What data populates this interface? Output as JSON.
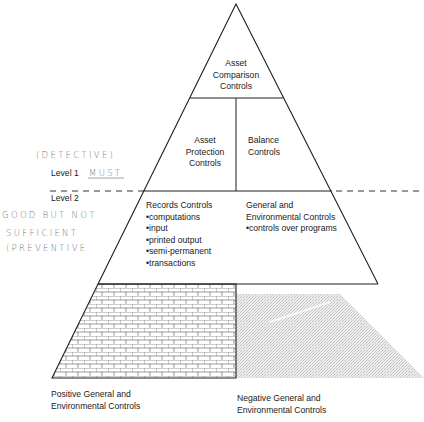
{
  "diagram": {
    "type": "control-hierarchy-pyramid",
    "tiers": [
      {
        "id": "top",
        "label_lines": [
          "Asset",
          "Comparison",
          "Controls"
        ]
      },
      {
        "id": "middle",
        "left": {
          "label_lines": [
            "Asset",
            "Protection",
            "Controls"
          ]
        },
        "right": {
          "label_lines": [
            "Balance",
            "Controls"
          ]
        }
      },
      {
        "id": "level2",
        "left": {
          "title": "Records Controls",
          "bullets": [
            "computations",
            "input",
            "printed output",
            "semi-permanent",
            "transactions"
          ]
        },
        "right": {
          "title_lines": [
            "General and",
            "Environmental Controls"
          ],
          "bullets": [
            "controls over programs"
          ]
        }
      },
      {
        "id": "base",
        "left": {
          "pattern": "brick",
          "caption_lines": [
            "Positive General and",
            "Environmental Controls"
          ]
        },
        "right": {
          "pattern": "gray-stipple",
          "caption_lines": [
            "Negative General and",
            "Environmental Controls"
          ]
        }
      }
    ],
    "levels": {
      "level1": "Level 1",
      "level2": "Level 2"
    },
    "annotations": {
      "detective": "(DETECTIVE)",
      "must": "MUST",
      "good_line1": "GOOD BUT NOT",
      "good_line2": "SUFFICIENT",
      "preventive": "(PREVENTIVE"
    },
    "colors": {
      "line": "#1f1f1f",
      "stipple": "#d0d0d0",
      "handwriting": "#777777"
    }
  }
}
